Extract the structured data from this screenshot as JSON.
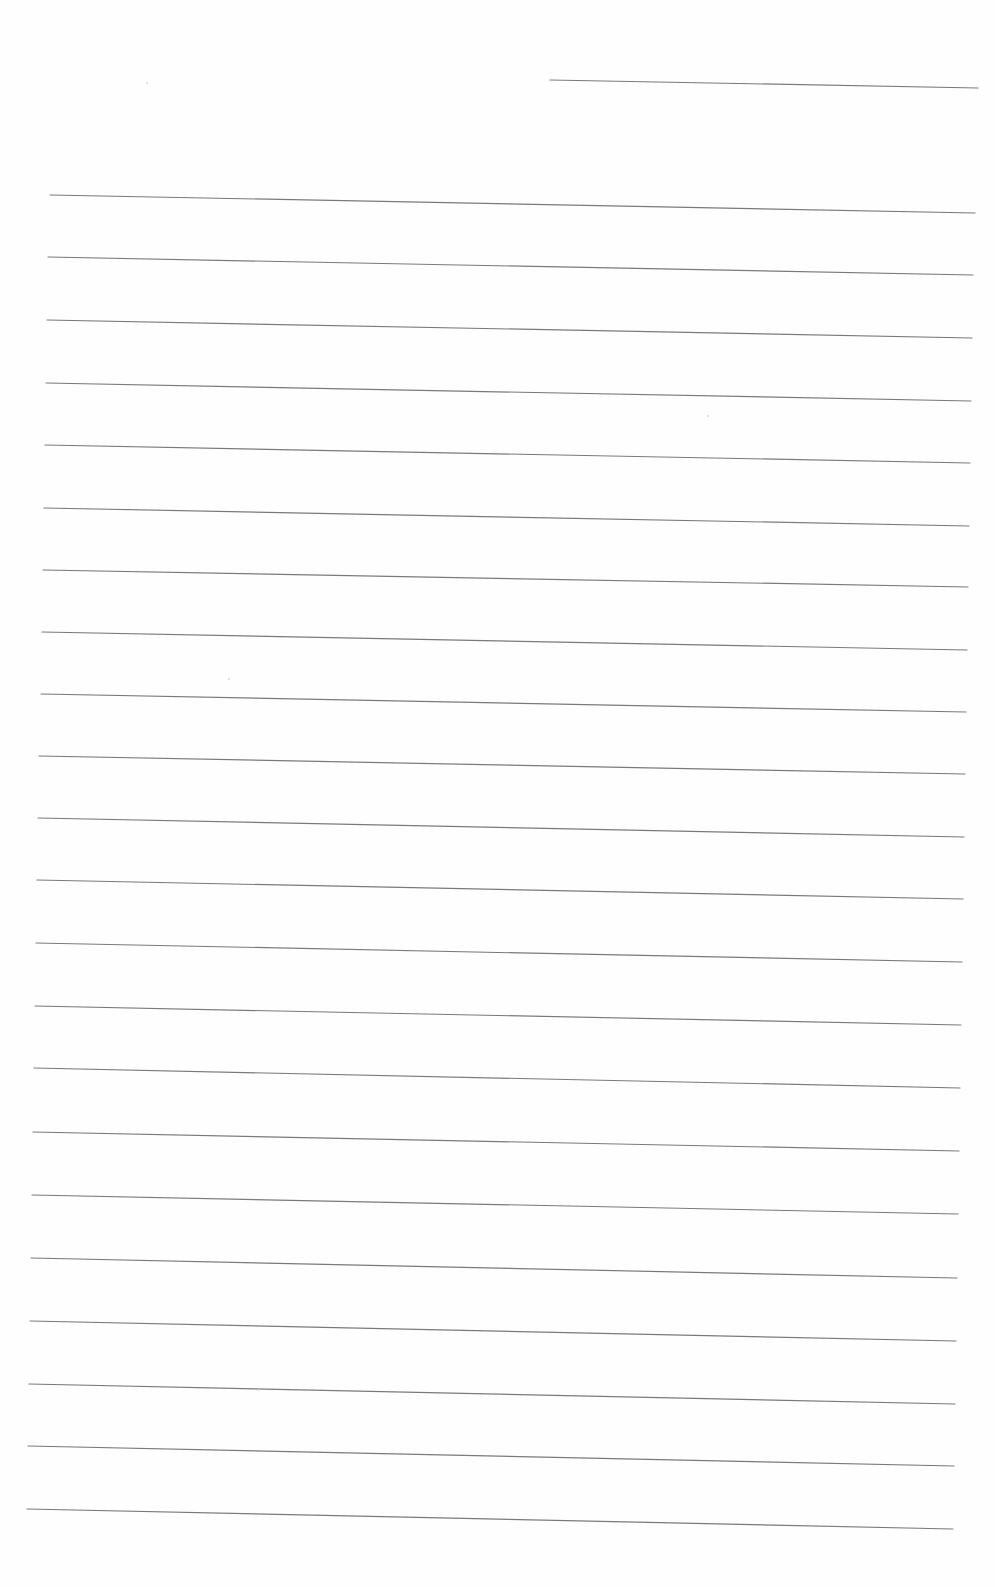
{
  "page": {
    "type": "ruled-lined-paper",
    "background": "#fefefe",
    "line_color": "#7a7a7a",
    "line_width": 1.2,
    "header_line": {
      "x1": 550,
      "y1": 80,
      "x2": 978,
      "y2": 88
    },
    "ruled_lines": [
      {
        "x1": 50,
        "y1": 195,
        "x2": 975,
        "y2": 213
      },
      {
        "x1": 48,
        "y1": 257,
        "x2": 973,
        "y2": 275
      },
      {
        "x1": 47,
        "y1": 320,
        "x2": 972,
        "y2": 338
      },
      {
        "x1": 46,
        "y1": 383,
        "x2": 971,
        "y2": 401
      },
      {
        "x1": 45,
        "y1": 445,
        "x2": 970,
        "y2": 463
      },
      {
        "x1": 44,
        "y1": 508,
        "x2": 969,
        "y2": 526
      },
      {
        "x1": 43,
        "y1": 570,
        "x2": 968,
        "y2": 587
      },
      {
        "x1": 42,
        "y1": 632,
        "x2": 967,
        "y2": 650
      },
      {
        "x1": 41,
        "y1": 694,
        "x2": 966,
        "y2": 712
      },
      {
        "x1": 39,
        "y1": 756,
        "x2": 965,
        "y2": 774
      },
      {
        "x1": 38,
        "y1": 818,
        "x2": 964,
        "y2": 837
      },
      {
        "x1": 37,
        "y1": 880,
        "x2": 963,
        "y2": 899
      },
      {
        "x1": 36,
        "y1": 943,
        "x2": 962,
        "y2": 962
      },
      {
        "x1": 35,
        "y1": 1006,
        "x2": 961,
        "y2": 1025
      },
      {
        "x1": 34,
        "y1": 1068,
        "x2": 960,
        "y2": 1088
      },
      {
        "x1": 33,
        "y1": 1132,
        "x2": 959,
        "y2": 1151
      },
      {
        "x1": 32,
        "y1": 1195,
        "x2": 958,
        "y2": 1214
      },
      {
        "x1": 31,
        "y1": 1258,
        "x2": 957,
        "y2": 1278
      },
      {
        "x1": 30,
        "y1": 1321,
        "x2": 956,
        "y2": 1341
      },
      {
        "x1": 29,
        "y1": 1384,
        "x2": 955,
        "y2": 1404
      },
      {
        "x1": 28,
        "y1": 1446,
        "x2": 954,
        "y2": 1466
      },
      {
        "x1": 27,
        "y1": 1509,
        "x2": 953,
        "y2": 1529
      }
    ],
    "specks": [
      {
        "x": 146,
        "y": 82
      },
      {
        "x": 707,
        "y": 415
      },
      {
        "x": 228,
        "y": 678
      },
      {
        "x": 258,
        "y": 1389
      }
    ]
  }
}
